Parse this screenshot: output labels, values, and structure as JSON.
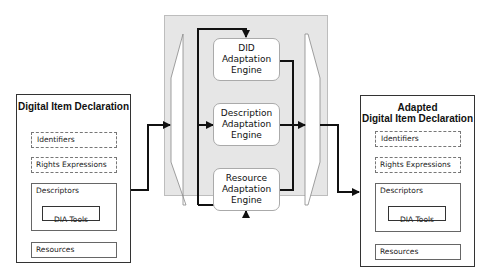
{
  "input_did": {
    "title": "Digital Item Declaration",
    "identifiers": "Identifiers",
    "rights": "Rights Expressions",
    "descriptors": "Descriptors",
    "dia_tools": "DIA Tools",
    "resources": "Resources"
  },
  "engines": [
    {
      "line1": "DID",
      "line2": "Adaptation",
      "line3": "Engine"
    },
    {
      "line1": "Description",
      "line2": "Adaptation",
      "line3": "Engine"
    },
    {
      "line1": "Resource",
      "line2": "Adaptation",
      "line3": "Engine"
    }
  ],
  "output_did": {
    "title_line1": "Adapted",
    "title_line2": "Digital Item Declaration",
    "identifiers": "Identifiers",
    "rights": "Rights Expressions",
    "descriptors": "Descriptors",
    "dia_tools": "DIA Tools",
    "resources": "Resources"
  },
  "colors": {
    "panel": "#e6e6e6",
    "line": "#111111"
  }
}
